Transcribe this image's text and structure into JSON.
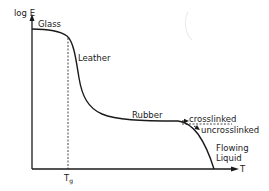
{
  "diagram": {
    "axes": {
      "y_label": "log E",
      "x_label": "T",
      "tick_label": "T",
      "tick_subscript": "g"
    },
    "regions": {
      "glass": "Glass",
      "leather": "Leather",
      "rubber": "Rubber",
      "flowing": "Flowing",
      "liquid": "Liquid"
    },
    "branches": {
      "crosslinked": "crosslinked",
      "uncrosslinked": "uncrosslinked"
    },
    "colors": {
      "line": "#1a1a1a",
      "background": "#ffffff"
    }
  }
}
